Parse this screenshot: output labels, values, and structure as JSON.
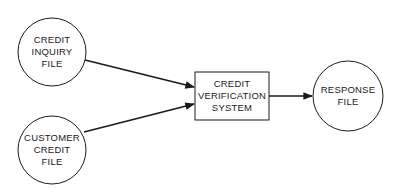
{
  "nodes": {
    "credit_inquiry": {
      "lines": [
        "CREDIT",
        "INQUIRY",
        "FILE"
      ]
    },
    "customer_credit": {
      "lines": [
        "CUSTOMER",
        "CREDIT",
        "FILE"
      ]
    },
    "verification": {
      "lines": [
        "CREDIT",
        "VERIFICATION",
        "SYSTEM"
      ]
    },
    "response": {
      "lines": [
        "RESPONSE",
        "FILE"
      ]
    }
  },
  "edges": [
    {
      "from": "credit_inquiry",
      "to": "verification"
    },
    {
      "from": "customer_credit",
      "to": "verification"
    },
    {
      "from": "verification",
      "to": "response"
    }
  ],
  "colors": {
    "stroke": "#1a1a1a",
    "background": "#ffffff"
  }
}
